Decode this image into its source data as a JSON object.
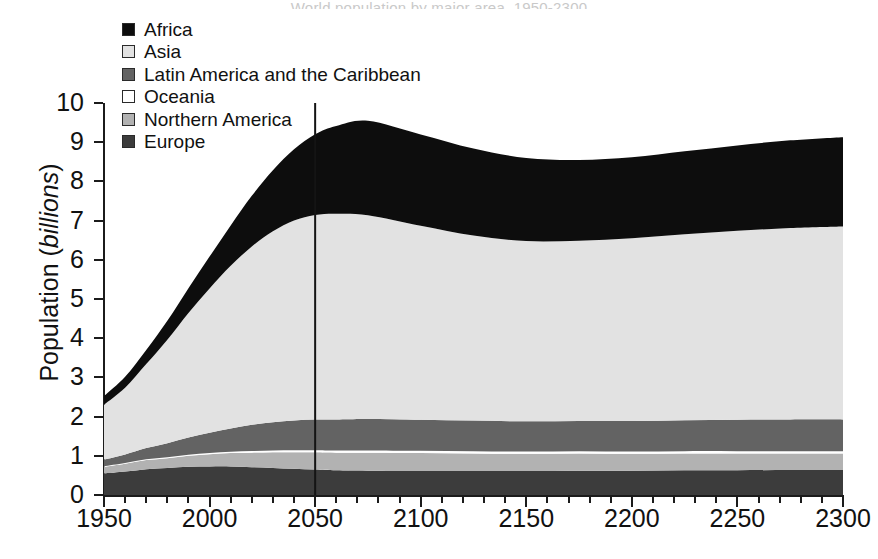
{
  "title_remnant": "World population by major area, 1950-2300",
  "axes": {
    "ylabel_prefix": "Population (",
    "ylabel_italic": "billions",
    "ylabel_suffix": ")",
    "y_ticks": [
      0,
      1,
      2,
      3,
      4,
      5,
      6,
      7,
      8,
      9,
      10
    ],
    "y_min": 0,
    "y_max": 10,
    "x_ticks": [
      1950,
      2000,
      2050,
      2100,
      2150,
      2200,
      2250,
      2300
    ],
    "x_min": 1950,
    "x_max": 2300,
    "x_minor_step": 10
  },
  "reference_line": {
    "year": 2050,
    "color": "#141414"
  },
  "legend": {
    "position": "top-left",
    "items": [
      {
        "label": "Africa",
        "color": "#0d0d0d",
        "swatch": "legend-swatch-africa"
      },
      {
        "label": "Asia",
        "color": "#e2e2e2",
        "swatch": "legend-swatch-asia"
      },
      {
        "label": "Latin America and the Caribbean",
        "color": "#636363",
        "swatch": "legend-swatch-latin-america"
      },
      {
        "label": "Oceania",
        "color": "#ffffff",
        "swatch": "legend-swatch-oceania"
      },
      {
        "label": "Northern America",
        "color": "#b2b2b2",
        "swatch": "legend-swatch-northern-america"
      },
      {
        "label": "Europe",
        "color": "#3c3c3c",
        "swatch": "legend-swatch-europe"
      }
    ]
  },
  "chart_data": {
    "type": "area",
    "stacked": true,
    "title": "World population by major area, 1950-2300",
    "xlabel": "",
    "ylabel": "Population (billions)",
    "xlim": [
      1950,
      2300
    ],
    "ylim": [
      0,
      10
    ],
    "grid": false,
    "legend_position": "top-left",
    "annotations": [
      {
        "type": "vline",
        "x": 2050,
        "label": "2050 projection divider"
      }
    ],
    "x": [
      1950,
      1960,
      1970,
      1980,
      1990,
      2000,
      2010,
      2020,
      2030,
      2040,
      2050,
      2060,
      2075,
      2100,
      2125,
      2150,
      2175,
      2200,
      2225,
      2250,
      2275,
      2300
    ],
    "stack_order_bottom_to_top": [
      "Europe",
      "Northern America",
      "Oceania",
      "Latin America and the Caribbean",
      "Asia",
      "Africa"
    ],
    "series": [
      {
        "name": "Europe",
        "color": "#3c3c3c",
        "values": [
          0.55,
          0.6,
          0.66,
          0.69,
          0.72,
          0.73,
          0.73,
          0.71,
          0.69,
          0.67,
          0.65,
          0.63,
          0.62,
          0.61,
          0.61,
          0.61,
          0.62,
          0.62,
          0.63,
          0.63,
          0.64,
          0.64
        ]
      },
      {
        "name": "Northern America",
        "color": "#b2b2b2",
        "values": [
          0.17,
          0.2,
          0.23,
          0.25,
          0.28,
          0.31,
          0.34,
          0.37,
          0.4,
          0.42,
          0.44,
          0.45,
          0.46,
          0.46,
          0.45,
          0.44,
          0.44,
          0.43,
          0.43,
          0.43,
          0.42,
          0.42
        ]
      },
      {
        "name": "Oceania",
        "color": "#ffffff",
        "values": [
          0.013,
          0.016,
          0.019,
          0.023,
          0.026,
          0.031,
          0.036,
          0.041,
          0.046,
          0.05,
          0.054,
          0.056,
          0.058,
          0.059,
          0.059,
          0.059,
          0.059,
          0.059,
          0.059,
          0.059,
          0.059,
          0.059
        ]
      },
      {
        "name": "Latin America and the Caribbean",
        "color": "#636363",
        "values": [
          0.17,
          0.22,
          0.29,
          0.36,
          0.44,
          0.52,
          0.59,
          0.67,
          0.72,
          0.76,
          0.78,
          0.79,
          0.8,
          0.79,
          0.78,
          0.77,
          0.77,
          0.78,
          0.79,
          0.8,
          0.81,
          0.81
        ]
      },
      {
        "name": "Asia",
        "color": "#e2e2e2",
        "values": [
          1.4,
          1.7,
          2.14,
          2.64,
          3.18,
          3.68,
          4.15,
          4.55,
          4.87,
          5.1,
          5.22,
          5.25,
          5.2,
          4.95,
          4.72,
          4.6,
          4.6,
          4.66,
          4.74,
          4.82,
          4.88,
          4.92
        ]
      },
      {
        "name": "Africa",
        "color": "#0d0d0d",
        "values": [
          0.22,
          0.28,
          0.36,
          0.48,
          0.63,
          0.81,
          1.03,
          1.29,
          1.56,
          1.82,
          2.06,
          2.24,
          2.41,
          2.33,
          2.22,
          2.12,
          2.06,
          2.07,
          2.12,
          2.18,
          2.24,
          2.28
        ]
      }
    ],
    "total_notes": {
      "value_1950": 2.52,
      "value_2000": 6.07,
      "value_2050": 9.2,
      "peak_value": 9.45,
      "peak_year": 2075,
      "trough_value": 8.55,
      "trough_year": 2175,
      "value_2300": 9.14
    }
  }
}
